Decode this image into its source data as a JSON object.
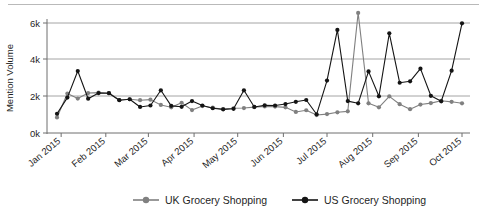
{
  "chart_data": {
    "type": "line",
    "title": "",
    "xlabel": "",
    "ylabel": "Mention Volume",
    "ylim": [
      0,
      6600
    ],
    "yticks": [
      0,
      2000,
      4000,
      6000
    ],
    "ytick_labels": [
      "0k",
      "2k",
      "4k",
      "6k"
    ],
    "grid": true,
    "legend_position": "bottom",
    "x_tick_labels": [
      "Jan 2015",
      "Feb 2015",
      "Mar 2015",
      "Apr 2015",
      "May 2015",
      "Jun 2015",
      "Jul 2015",
      "Aug 2015",
      "Sep 2015",
      "Oct 2015"
    ],
    "x_tick_positions_weeks": [
      0.4,
      4.7,
      8.8,
      13.2,
      17.4,
      21.8,
      26.0,
      30.4,
      34.8,
      39.0
    ],
    "x": [
      1,
      2,
      3,
      4,
      5,
      6,
      7,
      8,
      9,
      10,
      11,
      12,
      13,
      14,
      15,
      16,
      17,
      18,
      19,
      20,
      21,
      22,
      23,
      24,
      25,
      26,
      27,
      28,
      29,
      30,
      31,
      32,
      33,
      34,
      35,
      36,
      37,
      38,
      39,
      40
    ],
    "series": [
      {
        "name": "UK Grocery Shopping",
        "color": "#808080",
        "marker": "circle",
        "values": [
          850,
          2150,
          1880,
          2180,
          2200,
          2180,
          1800,
          1840,
          1790,
          1820,
          1530,
          1400,
          1650,
          1250,
          1470,
          1380,
          1300,
          1350,
          1360,
          1410,
          1450,
          1440,
          1400,
          1150,
          1240,
          980,
          1030,
          1130,
          1180,
          1900,
          1620,
          1400,
          2000,
          1570,
          1300,
          1550,
          1630,
          1760,
          1700,
          1620
        ]
      },
      {
        "name": "US Grocery Shopping",
        "color": "#141414",
        "marker": "circle",
        "values": [
          1050,
          1930,
          3380,
          1870,
          2180,
          2170,
          1790,
          1840,
          1420,
          1500,
          2330,
          1480,
          1430,
          1740,
          1500,
          1350,
          1290,
          1320,
          2330,
          1420,
          1510,
          1500,
          1580,
          1700,
          1800,
          1020,
          2860,
          5620,
          1740,
          1620,
          3360,
          2000,
          5440,
          2740,
          2820,
          3510,
          2030,
          1730,
          3400,
          5980
        ]
      }
    ],
    "series_uk_extra_spike": {
      "index": 29,
      "value": 6550,
      "note": "UK series peaks above top gridline near Jul 2015"
    },
    "us_final_point": 1880
  },
  "legend": {
    "items": [
      {
        "label": "UK Grocery Shopping",
        "color": "#808080"
      },
      {
        "label": "US Grocery Shopping",
        "color": "#141414"
      }
    ]
  }
}
